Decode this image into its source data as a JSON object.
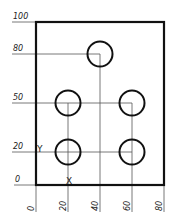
{
  "drawing": {
    "title": "Hole pattern coordinate drawing",
    "scale_px_per_unit": 1.6,
    "origin_px": [
      36,
      185
    ],
    "plate": {
      "x0": 0,
      "y0": 0,
      "width": 80,
      "height": 100
    },
    "x_dimensions": [
      "0",
      "20",
      "40",
      "60",
      "80"
    ],
    "y_dimensions": [
      "0",
      "20",
      "50",
      "80",
      "100"
    ],
    "axis_labels": {
      "x": "X",
      "y": "Y"
    },
    "holes": [
      {
        "x": 40,
        "y": 80,
        "diameter": 16
      },
      {
        "x": 20,
        "y": 50,
        "diameter": 16
      },
      {
        "x": 60,
        "y": 50,
        "diameter": 16
      },
      {
        "x": 20,
        "y": 20,
        "diameter": 16
      },
      {
        "x": 60,
        "y": 20,
        "diameter": 16
      }
    ],
    "colors": {
      "outline": "#111111",
      "leader": "#555555",
      "text": "#222222"
    }
  }
}
